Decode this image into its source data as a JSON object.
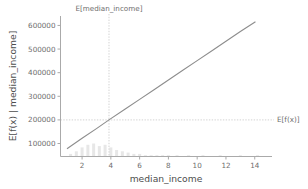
{
  "chart_data": {
    "type": "line",
    "title": "",
    "subtitle": "",
    "xlabel": "median_income",
    "ylabel": "E[f(x) | median_income]",
    "xlim": [
      0.5,
      15.2
    ],
    "ylim": [
      45000,
      640000
    ],
    "grid": false,
    "legend": null,
    "xticks": [
      2,
      4,
      6,
      8,
      10,
      12,
      14
    ],
    "xtick_labels": [
      "2",
      "4",
      "6",
      "8",
      "10",
      "12",
      "14"
    ],
    "yticks": [
      100000,
      200000,
      300000,
      400000,
      500000,
      600000
    ],
    "ytick_labels": [
      "100000",
      "200000",
      "300000",
      "400000",
      "500000",
      "600000"
    ],
    "series": [
      {
        "name": "E[f(x) | median_income]",
        "color": "#8d8d8d",
        "x": [
          0.95,
          2.0,
          3.0,
          3.87,
          5.0,
          6.0,
          7.0,
          8.0,
          9.0,
          10.0,
          11.0,
          12.0,
          13.0,
          14.05
        ],
        "values": [
          78000,
          122000,
          163000,
          200000,
          246000,
          287000,
          328000,
          369000,
          410000,
          451000,
          492000,
          533000,
          574000,
          616000
        ]
      }
    ],
    "annotations": [
      {
        "name": "expected-x-annotation",
        "text": "E[median_income]",
        "x": 3.87,
        "orientation": "vertical",
        "position": "top"
      },
      {
        "name": "expected-y-annotation",
        "text": "E[f(x)]",
        "y": 200000,
        "orientation": "horizontal",
        "position": "right"
      }
    ],
    "rug_histogram": {
      "name": "median_income_distribution",
      "color": "#d3d3d3",
      "bin_centers": [
        1.2,
        1.6,
        2.0,
        2.4,
        2.8,
        3.2,
        3.6,
        4.0,
        4.4,
        4.8,
        5.2,
        5.6,
        6.0,
        6.4,
        6.8,
        7.2,
        7.6,
        8.0,
        8.6,
        9.4,
        10.4,
        11.6,
        13.0,
        14.2
      ],
      "counts": [
        2,
        4,
        7,
        9,
        10,
        8,
        9,
        7,
        5,
        4,
        3,
        2,
        2,
        1,
        1,
        1,
        1,
        1,
        1,
        1,
        1,
        1,
        1,
        1
      ]
    },
    "colors": {
      "line": "#8d8d8d",
      "guide": "#c8c8c8",
      "axis": "#aaaaaa",
      "text": "#6e6e6e",
      "background": "#ffffff",
      "histogram": "#d3d3d3"
    }
  }
}
